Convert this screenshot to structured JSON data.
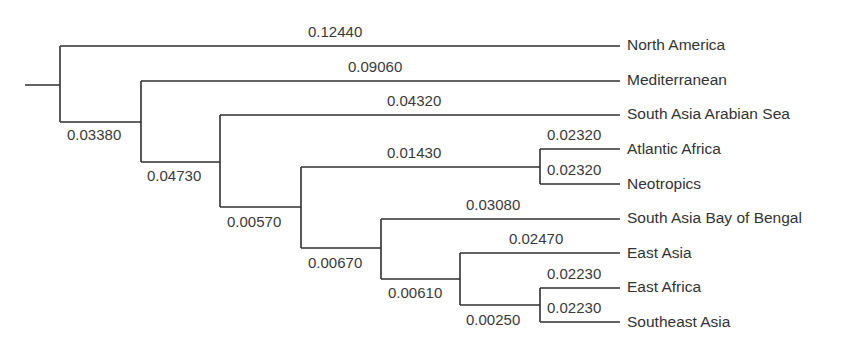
{
  "diagram": {
    "type": "phylogenetic-tree",
    "leaves": [
      {
        "name": "North America",
        "branch_length": "0.12440"
      },
      {
        "name": "Mediterranean",
        "branch_length": "0.09060"
      },
      {
        "name": "South Asia Arabian Sea",
        "branch_length": "0.04320"
      },
      {
        "name": "Atlantic Africa",
        "branch_length": "0.02320"
      },
      {
        "name": "Neotropics",
        "branch_length": "0.02320"
      },
      {
        "name": "South Asia Bay of Bengal",
        "branch_length": "0.03080"
      },
      {
        "name": "East Asia",
        "branch_length": "0.02470"
      },
      {
        "name": "East Africa",
        "branch_length": "0.02230"
      },
      {
        "name": "Southeast Asia",
        "branch_length": "0.02230"
      }
    ],
    "internal_branches": [
      {
        "id": "n2",
        "branch_length": "0.03380"
      },
      {
        "id": "n3",
        "branch_length": "0.04730"
      },
      {
        "id": "n4",
        "branch_length": "0.00570"
      },
      {
        "id": "n_atl_neo",
        "branch_length": "0.01430"
      },
      {
        "id": "n5",
        "branch_length": "0.00670"
      },
      {
        "id": "n6",
        "branch_length": "0.00610"
      },
      {
        "id": "n7",
        "branch_length": "0.00250"
      }
    ]
  }
}
